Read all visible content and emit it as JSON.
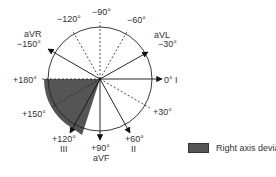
{
  "diagram": {
    "center": [
      100,
      79
    ],
    "radius": 52,
    "shaded_sector": {
      "from_deg": 90,
      "to_deg": 180,
      "label": "Right axis deviation",
      "color": "#555555"
    },
    "axes": [
      {
        "angle": 0,
        "label": "0° I",
        "type": "solid-arrow"
      },
      {
        "angle": 60,
        "label": "+60°",
        "sublabel": "II",
        "type": "solid-arrow"
      },
      {
        "angle": 120,
        "label": "+120°",
        "sublabel": "III",
        "type": "solid-arrow"
      },
      {
        "angle": 90,
        "label": "+90°",
        "sublabel": "aVF",
        "type": "solid-arrow"
      },
      {
        "angle": -150,
        "label": "−150°",
        "sublabel": "aVR",
        "type": "solid-arrow"
      },
      {
        "angle": -30,
        "label": "−30°",
        "sublabel": "aVL",
        "type": "solid-arrow"
      },
      {
        "angle": 180,
        "label": "+180°",
        "type": "dashed"
      },
      {
        "angle": 150,
        "label": "+150°",
        "type": "dashed"
      },
      {
        "angle": 30,
        "label": "+30°",
        "type": "dashed"
      },
      {
        "angle": -90,
        "label": "−90°",
        "type": "dashed"
      },
      {
        "angle": -120,
        "label": "−120°",
        "type": "dashed"
      },
      {
        "angle": -60,
        "label": "−60°",
        "type": "dashed"
      }
    ]
  },
  "labels": {
    "m90": "−90°",
    "m120": "−120°",
    "m60": "−60°",
    "avr": "aVR",
    "m150": "−150°",
    "avl": "aVL",
    "m30": "−30°",
    "p180": "+180°",
    "zero": "0° I",
    "p150": "+150°",
    "p30": "+30°",
    "p120": "+120°",
    "iii": "III",
    "p90": "+90°",
    "avf": "aVF",
    "p60": "+60°",
    "ii": "II"
  },
  "legend": {
    "label": "Right axis deviation",
    "color": "#555555"
  }
}
